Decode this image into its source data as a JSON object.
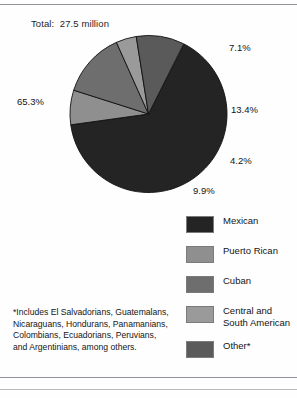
{
  "chart_data": {
    "type": "pie",
    "title": "Total:  27.5 million",
    "categories": [
      "Mexican",
      "Puerto Rican",
      "Cuban",
      "Central and South American",
      "Other*"
    ],
    "values": [
      65.3,
      7.1,
      13.4,
      4.2,
      9.9
    ],
    "value_labels": [
      "65.3%",
      "7.1%",
      "13.4%",
      "4.2%",
      "9.9%"
    ],
    "unit": "percent",
    "total": "27.5 million",
    "colors": [
      "#242424",
      "#8f8f8f",
      "#6e6e6e",
      "#9a9a9a",
      "#5a5a5a"
    ],
    "legend_position": "right",
    "grid": false,
    "xlabel": "",
    "ylabel": "",
    "annotations": [
      "*Includes El Salvadorians, Guatemalans,",
      "Nicaraguans, Hondurans, Panamanians,",
      "Colombians, Ecuadorians, Peruvians,",
      "and Argentinians, among others."
    ]
  },
  "legend": {
    "items": [
      {
        "label": "Mexican",
        "label2": "",
        "color": "#242424"
      },
      {
        "label": "Puerto Rican",
        "label2": "",
        "color": "#8f8f8f"
      },
      {
        "label": "Cuban",
        "label2": "",
        "color": "#6e6e6e"
      },
      {
        "label": "Central and",
        "label2": "South American",
        "color": "#9a9a9a"
      },
      {
        "label": "Other*",
        "label2": "",
        "color": "#5a5a5a"
      }
    ]
  },
  "footnote": {
    "line1": "*Includes El Salvadorians, Guatemalans,",
    "line2": "Nicaraguans, Hondurans, Panamanians,",
    "line3": "Colombians, Ecuadorians, Peruvians,",
    "line4": "and Argentinians, among others."
  }
}
